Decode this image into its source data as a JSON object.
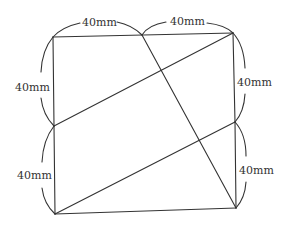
{
  "diagram": {
    "stroke_color": "#333333",
    "background": "#ffffff",
    "points": {
      "top_left": [
        53,
        37
      ],
      "top_mid": [
        142,
        35
      ],
      "top_right": [
        233,
        33
      ],
      "left_mid": [
        54,
        126
      ],
      "right_mid": [
        235,
        122
      ],
      "bottom_left": [
        55,
        214
      ],
      "bottom_right": [
        236,
        208
      ]
    },
    "labels": {
      "top_left_segment": "40mm",
      "top_right_segment": "40mm",
      "left_upper_segment": "40mm",
      "left_lower_segment": "40mm",
      "right_upper_segment": "40mm",
      "right_lower_segment": "40mm"
    }
  }
}
